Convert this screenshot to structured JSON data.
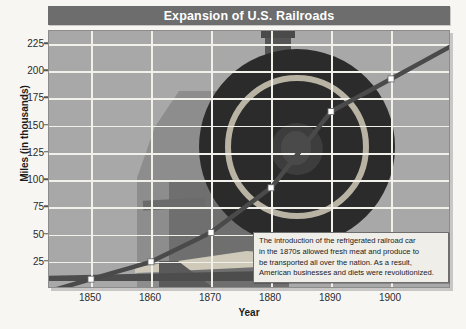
{
  "chart_data": {
    "type": "line",
    "title": "Expansion of U.S. Railroads",
    "xlabel": "Year",
    "ylabel": "Miles (in thousands)",
    "xlim": [
      1843,
      1910
    ],
    "ylim": [
      0,
      237
    ],
    "x": [
      1850,
      1860,
      1870,
      1880,
      1890,
      1900
    ],
    "values": [
      9,
      25,
      52,
      93,
      163,
      193
    ],
    "series": [
      {
        "name": "Miles of railroad track",
        "values": [
          9,
          25,
          52,
          93,
          163,
          193
        ]
      }
    ],
    "xticks": [
      1850,
      1860,
      1870,
      1880,
      1890,
      1900
    ],
    "yticks": [
      25,
      50,
      75,
      100,
      125,
      150,
      175,
      200,
      225
    ],
    "grid": true,
    "legend": "none",
    "line_color": "#4a4a4a",
    "marker_color": "#ffffff",
    "plot_background": "#a8a8a8",
    "gridline_color": "#f2f0ea",
    "title_background": "#6d6d6d",
    "title_color": "#ffffff",
    "annotations": [
      {
        "name": "refrigerated-car-note",
        "lines": [
          "The introduction of the refrigerated railroad car",
          "in the 1870s allowed fresh meat and produce to",
          "be transported all over the nation. As a result,",
          "American businesses and diets were revolutionized."
        ]
      }
    ]
  },
  "background_art": {
    "description": "steam locomotive drive wheel watermark"
  }
}
